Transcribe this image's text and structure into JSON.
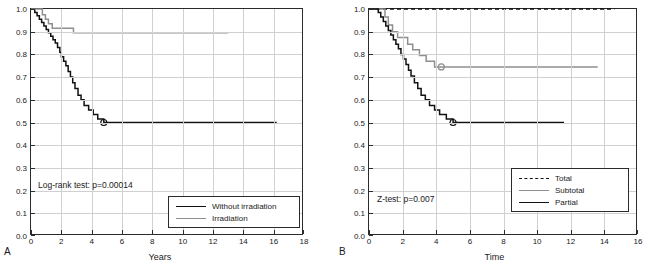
{
  "figure": {
    "panelA_letter": "A",
    "panelB_letter": "B"
  },
  "chart_data": [
    {
      "type": "line",
      "panel": "A",
      "title": "",
      "xlabel": "Years",
      "ylabel": "",
      "xlim": [
        0,
        18
      ],
      "ylim": [
        0,
        1.0
      ],
      "xticks": [
        "0",
        "2",
        "4",
        "6",
        "8",
        "10",
        "12",
        "14",
        "16",
        "18"
      ],
      "yticks": [
        "0.0",
        "0.1",
        "0.2",
        "0.3",
        "0.4",
        "0.5",
        "0.6",
        "0.7",
        "0.8",
        "0.9",
        "1.0"
      ],
      "grid": true,
      "annotation": "Log-rank test: p=0.00014",
      "legend_position": "bottom-right",
      "series": [
        {
          "name": "Without irradiation",
          "color": "#111111",
          "style": "solid",
          "points": [
            [
              0.0,
              1.0
            ],
            [
              0.25,
              0.985
            ],
            [
              0.4,
              0.97
            ],
            [
              0.55,
              0.955
            ],
            [
              0.7,
              0.94
            ],
            [
              0.85,
              0.925
            ],
            [
              1.0,
              0.91
            ],
            [
              1.15,
              0.895
            ],
            [
              1.3,
              0.88
            ],
            [
              1.45,
              0.865
            ],
            [
              1.6,
              0.85
            ],
            [
              1.75,
              0.83
            ],
            [
              1.9,
              0.81
            ],
            [
              2.0,
              0.79
            ],
            [
              2.15,
              0.77
            ],
            [
              2.3,
              0.75
            ],
            [
              2.45,
              0.725
            ],
            [
              2.6,
              0.7
            ],
            [
              2.75,
              0.675
            ],
            [
              2.9,
              0.65
            ],
            [
              3.1,
              0.62
            ],
            [
              3.3,
              0.6
            ],
            [
              3.5,
              0.575
            ],
            [
              3.8,
              0.555
            ],
            [
              4.1,
              0.535
            ],
            [
              4.4,
              0.515
            ],
            [
              4.8,
              0.5
            ],
            [
              16.2,
              0.5
            ]
          ],
          "censor_marks": [
            [
              4.8,
              0.5
            ]
          ]
        },
        {
          "name": "Irradiation",
          "color": "#8f8f8f",
          "style": "solid",
          "points": [
            [
              0.0,
              1.0
            ],
            [
              0.6,
              1.0
            ],
            [
              0.75,
              0.975
            ],
            [
              0.95,
              0.955
            ],
            [
              1.15,
              0.935
            ],
            [
              1.4,
              0.915
            ],
            [
              2.6,
              0.915
            ],
            [
              2.8,
              0.895
            ],
            [
              3.0,
              0.895
            ],
            [
              13.0,
              0.895
            ]
          ],
          "censor_marks": []
        }
      ]
    },
    {
      "type": "line",
      "panel": "B",
      "title": "",
      "xlabel": "Time",
      "ylabel": "",
      "xlim": [
        0,
        16
      ],
      "ylim": [
        0,
        1.0
      ],
      "xticks": [
        "0",
        "2",
        "4",
        "6",
        "8",
        "10",
        "12",
        "14",
        "16"
      ],
      "yticks": [
        "0.0",
        "0.1",
        "0.2",
        "0.3",
        "0.4",
        "0.5",
        "0.6",
        "0.7",
        "0.8",
        "0.9",
        "1.0"
      ],
      "grid": true,
      "annotation": "Z-test: p=0.007",
      "legend_position": "bottom-right",
      "series": [
        {
          "name": "Total",
          "color": "#111111",
          "style": "dashed",
          "points": [
            [
              0.0,
              1.0
            ],
            [
              14.6,
              1.0
            ]
          ],
          "censor_marks": []
        },
        {
          "name": "Subtotal",
          "color": "#8f8f8f",
          "style": "solid",
          "points": [
            [
              0.0,
              1.0
            ],
            [
              0.75,
              1.0
            ],
            [
              0.95,
              0.965
            ],
            [
              1.15,
              0.93
            ],
            [
              1.4,
              0.9
            ],
            [
              1.7,
              0.875
            ],
            [
              2.0,
              0.875
            ],
            [
              2.3,
              0.845
            ],
            [
              2.6,
              0.82
            ],
            [
              3.0,
              0.795
            ],
            [
              3.4,
              0.77
            ],
            [
              3.9,
              0.745
            ],
            [
              4.3,
              0.745
            ],
            [
              13.6,
              0.745
            ]
          ],
          "censor_marks": [
            [
              4.3,
              0.745
            ]
          ]
        },
        {
          "name": "Partial",
          "color": "#111111",
          "style": "solid",
          "points": [
            [
              0.0,
              1.0
            ],
            [
              0.55,
              0.985
            ],
            [
              0.7,
              0.965
            ],
            [
              0.85,
              0.945
            ],
            [
              1.0,
              0.925
            ],
            [
              1.15,
              0.905
            ],
            [
              1.3,
              0.885
            ],
            [
              1.45,
              0.865
            ],
            [
              1.6,
              0.845
            ],
            [
              1.75,
              0.825
            ],
            [
              1.9,
              0.8
            ],
            [
              2.05,
              0.78
            ],
            [
              2.2,
              0.755
            ],
            [
              2.35,
              0.73
            ],
            [
              2.5,
              0.705
            ],
            [
              2.7,
              0.675
            ],
            [
              2.9,
              0.65
            ],
            [
              3.1,
              0.62
            ],
            [
              3.35,
              0.6
            ],
            [
              3.6,
              0.575
            ],
            [
              3.9,
              0.555
            ],
            [
              4.2,
              0.535
            ],
            [
              4.6,
              0.515
            ],
            [
              5.0,
              0.5
            ],
            [
              11.6,
              0.5
            ]
          ],
          "censor_marks": [
            [
              5.0,
              0.5
            ]
          ]
        }
      ]
    }
  ]
}
